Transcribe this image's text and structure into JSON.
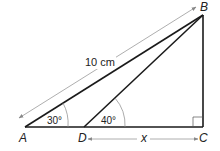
{
  "diagram": {
    "type": "geometry",
    "colors": {
      "stroke": "#1a1a1a",
      "arrow": "#888888",
      "text": "#222222"
    },
    "vertices": [
      {
        "id": "A",
        "label": "A",
        "x": 25,
        "y": 127
      },
      {
        "id": "B",
        "label": "B",
        "x": 203,
        "y": 15
      },
      {
        "id": "C",
        "label": "C",
        "x": 203,
        "y": 127
      },
      {
        "id": "D",
        "label": "D",
        "x": 84,
        "y": 127
      }
    ],
    "segments": [
      {
        "from": "A",
        "to": "B"
      },
      {
        "from": "D",
        "to": "B"
      },
      {
        "from": "A",
        "to": "C"
      },
      {
        "from": "B",
        "to": "C"
      }
    ],
    "angles": [
      {
        "at": "A",
        "label": "30°"
      },
      {
        "at": "D",
        "label": "40°"
      },
      {
        "at": "C",
        "label": "right-angle"
      }
    ],
    "measurements": [
      {
        "between": [
          "A",
          "B"
        ],
        "label": "10 cm"
      },
      {
        "between": [
          "D",
          "C"
        ],
        "label": "x"
      }
    ]
  },
  "labels": {
    "A": "A",
    "B": "B",
    "C": "C",
    "D": "D",
    "angle_A": "30°",
    "angle_D": "40°",
    "length_AB": "10 cm",
    "length_DC": "x"
  }
}
